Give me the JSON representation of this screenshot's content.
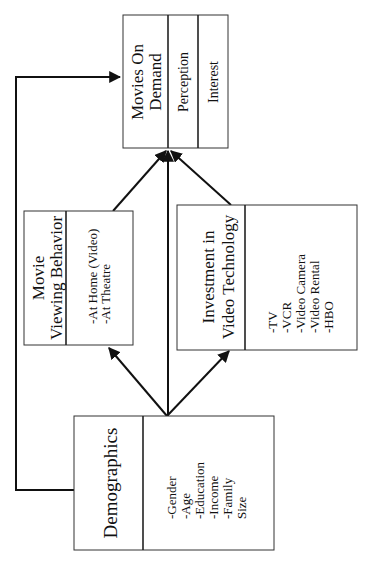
{
  "diagram": {
    "orientation": "rotated-90-ccw",
    "nodes": {
      "demographics": {
        "title": "Demographics",
        "items": [
          "-Gender",
          "-Age",
          "-Education",
          "-Income",
          "-Family",
          "Size"
        ]
      },
      "movie_viewing": {
        "title_line1": "Movie",
        "title_line2": "Viewing Behavior",
        "items": [
          "-At Home (Video)",
          "-At Theatre"
        ]
      },
      "investment": {
        "title_line1": "Investment in",
        "title_line2": "Video Technology",
        "items": [
          "-TV",
          "-VCR",
          "-Video Camera",
          "-Video Rental",
          "-HBO"
        ]
      },
      "movies_on_demand": {
        "title_line1": "Movies On",
        "title_line2": "Demand",
        "sub1": "Perception",
        "sub2": "Interest"
      }
    },
    "edges": [
      {
        "from": "Demographics",
        "to": "Movie Viewing Behavior"
      },
      {
        "from": "Demographics",
        "to": "Investment in Video Technology"
      },
      {
        "from": "Demographics",
        "to": "Movies On Demand"
      },
      {
        "from": "Demographics",
        "to": "Movies On Demand",
        "style": "elbow feedback line"
      },
      {
        "from": "Movie Viewing Behavior",
        "to": "Movies On Demand"
      },
      {
        "from": "Investment in Video Technology",
        "to": "Movies On Demand"
      }
    ],
    "colors": {
      "line": "#111111",
      "background": "#ffffff"
    }
  }
}
